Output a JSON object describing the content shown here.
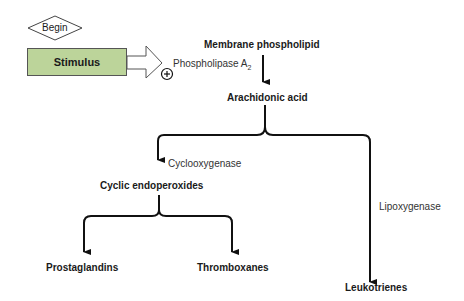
{
  "diagram": {
    "begin": "Begin",
    "stimulus": "Stimulus",
    "enzyme_pla2": "Phospholipase A",
    "enzyme_pla2_sub": "2",
    "plus_sign": "+",
    "nodes": {
      "membrane": "Membrane phospholipid",
      "arachidonic": "Arachidonic acid",
      "cyclic": "Cyclic endoperoxides",
      "prostaglandins": "Prostaglandins",
      "thromboxanes": "Thromboxanes",
      "leukotrienes": "Leukotrienes"
    },
    "enzymes": {
      "cox": "Cyclooxygenase",
      "lox": "Lipoxygenase"
    },
    "colors": {
      "stimulus_fill": "#bcd49a",
      "line": "#111111"
    }
  }
}
